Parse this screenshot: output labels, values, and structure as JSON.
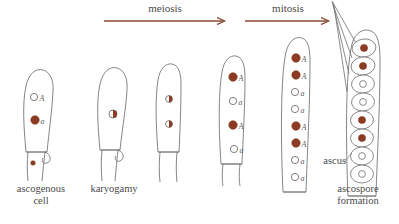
{
  "figure": {
    "background_color": "#ffffff",
    "outline_color": "#6b6b6b",
    "nucleus_fill_color": "#8d3b22",
    "nucleus_open_color": "#ffffff",
    "arrow_color": "#8a4a32",
    "label_color": "#4a4a4a"
  },
  "arrows": [
    {
      "id": "meiosis-arrow",
      "label": "meiosis",
      "x1": 104,
      "x2": 226,
      "y": 21,
      "label_x": 165,
      "label_y": 4
    },
    {
      "id": "mitosis-arrow",
      "label": "mitosis",
      "x1": 245,
      "x2": 330,
      "y": 21,
      "label_x": 288,
      "label_y": 4
    }
  ],
  "stage_labels": [
    {
      "id": "ascogenous-cell-label",
      "text": "ascogenous\ncell",
      "x": 5,
      "y": 183,
      "width": 72
    },
    {
      "id": "karyogamy-label",
      "text": "karyogamy",
      "x": 78,
      "y": 183,
      "width": 72
    },
    {
      "id": "ascus-label",
      "text": "ascus",
      "x": 308,
      "y": 155,
      "width": 36
    },
    {
      "id": "ascospore-formation-label",
      "text": "ascospore\nformation",
      "x": 322,
      "y": 183,
      "width": 72
    }
  ],
  "cells": [
    {
      "id": "cell-1-ascogenous",
      "stage": "ascogenous cell",
      "center_x": 42,
      "nuclei": [
        {
          "label": "A",
          "type": "open",
          "cx": 34,
          "cy": 97,
          "r": 3.6
        },
        {
          "label": "a",
          "type": "filled",
          "cx": 35,
          "cy": 120,
          "r": 4.2
        }
      ],
      "crozier_nucleus": {
        "type": "filled",
        "cx": 33,
        "cy": 163,
        "r": 2.3
      }
    },
    {
      "id": "cell-2-karyogamy",
      "stage": "karyogamy",
      "center_x": 113,
      "nuclei": [
        {
          "label": "",
          "type": "half",
          "cx": 113,
          "cy": 114,
          "r": 4.0
        }
      ]
    },
    {
      "id": "cell-3-meiosis-i",
      "stage": "meiosis I",
      "center_x": 169,
      "nuclei": [
        {
          "label": "",
          "type": "half",
          "cx": 169,
          "cy": 99,
          "r": 3.4
        },
        {
          "label": "",
          "type": "half",
          "cx": 169,
          "cy": 124,
          "r": 3.4
        }
      ]
    },
    {
      "id": "cell-4-meiosis-ii",
      "stage": "meiosis II",
      "center_x": 232,
      "nuclei": [
        {
          "label": "A",
          "type": "filled",
          "cx": 233,
          "cy": 77,
          "r": 4.2
        },
        {
          "label": "a",
          "type": "open",
          "cx": 233,
          "cy": 101,
          "r": 3.6
        },
        {
          "label": "A",
          "type": "filled",
          "cx": 233,
          "cy": 125,
          "r": 4.2
        },
        {
          "label": "a",
          "type": "open",
          "cx": 234,
          "cy": 149,
          "r": 3.6
        }
      ]
    },
    {
      "id": "cell-5-mitosis",
      "stage": "post-mitotic ascus",
      "center_x": 295,
      "nuclei": [
        {
          "label": "A",
          "type": "filled",
          "cx": 296,
          "cy": 58,
          "r": 4.2
        },
        {
          "label": "A",
          "type": "filled",
          "cx": 296,
          "cy": 75,
          "r": 4.2
        },
        {
          "label": "a",
          "type": "open",
          "cx": 295,
          "cy": 92,
          "r": 3.6
        },
        {
          "label": "a",
          "type": "open",
          "cx": 295,
          "cy": 109,
          "r": 3.6
        },
        {
          "label": "A",
          "type": "filled",
          "cx": 296,
          "cy": 126,
          "r": 4.2
        },
        {
          "label": "A",
          "type": "filled",
          "cx": 296,
          "cy": 143,
          "r": 4.2
        },
        {
          "label": "a",
          "type": "open",
          "cx": 295,
          "cy": 160,
          "r": 3.6
        },
        {
          "label": "a",
          "type": "open",
          "cx": 295,
          "cy": 177,
          "r": 3.6
        }
      ]
    }
  ],
  "ascospores": {
    "id": "ascospore-column",
    "center_x": 362,
    "count": 8,
    "spores": [
      {
        "index": 1,
        "cy": 48,
        "nucleus": "filled"
      },
      {
        "index": 2,
        "cy": 66,
        "nucleus": "filled"
      },
      {
        "index": 3,
        "cy": 84,
        "nucleus": "open"
      },
      {
        "index": 4,
        "cy": 102,
        "nucleus": "open"
      },
      {
        "index": 5,
        "cy": 120,
        "nucleus": "filled"
      },
      {
        "index": 6,
        "cy": 138,
        "nucleus": "filled"
      },
      {
        "index": 7,
        "cy": 156,
        "nucleus": "open"
      },
      {
        "index": 8,
        "cy": 174,
        "nucleus": "open"
      }
    ]
  }
}
